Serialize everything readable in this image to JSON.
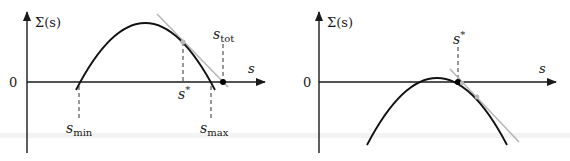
{
  "figure": {
    "colors": {
      "curve": "#111111",
      "axis": "#1a1a1a",
      "tangent": "#b8b8b8",
      "tangent_point": "#b8b8b8",
      "marked_point": "#000000"
    },
    "panels": [
      {
        "id": "left",
        "y_axis_label": "Σ(s)",
        "x_axis_label": "s",
        "origin_label": "0",
        "marks": {
          "s_min": {
            "label_base": "s",
            "label_sub": "min"
          },
          "s_star": {
            "label_base": "s",
            "label_sup": "*"
          },
          "s_max": {
            "label_base": "s",
            "label_sub": "max"
          },
          "s_tot": {
            "label_base": "s",
            "label_sub": "tot"
          }
        },
        "notes": "Curve positive between s_min and s_max; tangent at s* intersects the s-axis at s_tot."
      },
      {
        "id": "right",
        "y_axis_label": "Σ(s)",
        "x_axis_label": "s",
        "origin_label": "0",
        "marks": {
          "s_star": {
            "label_base": "s",
            "label_sup": "*"
          }
        },
        "notes": "Curve barely crosses zero; s* is the upper zero crossing, tangent passes through it."
      }
    ]
  }
}
